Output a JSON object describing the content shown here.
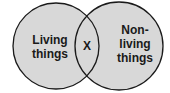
{
  "diagram": {
    "type": "venn",
    "sets": [
      {
        "id": "left",
        "label": "Living\nthings"
      },
      {
        "id": "right",
        "label": "Non-\nliving\nthings"
      }
    ],
    "intersection": {
      "label": "X"
    },
    "colors": {
      "fill": "#d8d8d8",
      "stroke": "#1a1a1a",
      "text": "#1a1a1a"
    }
  }
}
